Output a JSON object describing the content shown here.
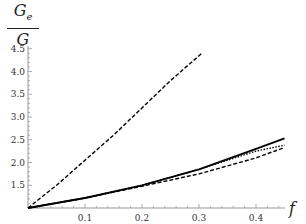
{
  "chart_data": {
    "type": "line",
    "title": "",
    "ylabel_num": "G",
    "ylabel_sub": "e",
    "ylabel_den": "G",
    "xlabel": "f",
    "xlim": [
      0,
      0.46
    ],
    "ylim": [
      1.0,
      4.5
    ],
    "x_ticks": [
      "0.1",
      "0.2",
      "0.3",
      "0.4"
    ],
    "y_ticks": [
      "1.5",
      "2.0",
      "2.5",
      "3.0",
      "3.5",
      "4.0",
      "4.5"
    ],
    "grid": false,
    "series": [
      {
        "name": "dashed-steep",
        "style": "dashed",
        "x": [
          0,
          0.05,
          0.1,
          0.15,
          0.2,
          0.25,
          0.305
        ],
        "y": [
          1.0,
          1.5,
          2.05,
          2.6,
          3.2,
          3.8,
          4.4
        ]
      },
      {
        "name": "solid",
        "style": "solid",
        "x": [
          0,
          0.1,
          0.2,
          0.3,
          0.4,
          0.45
        ],
        "y": [
          1.0,
          1.22,
          1.5,
          1.85,
          2.3,
          2.53
        ]
      },
      {
        "name": "dotted",
        "style": "dotted",
        "x": [
          0,
          0.1,
          0.2,
          0.3,
          0.4,
          0.45
        ],
        "y": [
          1.0,
          1.22,
          1.5,
          1.85,
          2.25,
          2.38
        ]
      },
      {
        "name": "dashed-low",
        "style": "dashed",
        "x": [
          0,
          0.1,
          0.2,
          0.3,
          0.4,
          0.45
        ],
        "y": [
          1.0,
          1.22,
          1.48,
          1.75,
          2.1,
          2.33
        ]
      }
    ]
  }
}
